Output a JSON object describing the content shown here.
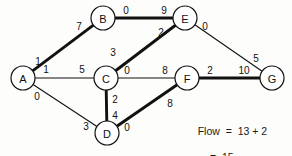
{
  "diagram": {
    "nodes": [
      {
        "id": "A",
        "label": "A",
        "cx": 23,
        "cy": 78,
        "r": 12
      },
      {
        "id": "B",
        "label": "B",
        "cx": 103,
        "cy": 18,
        "r": 12
      },
      {
        "id": "C",
        "label": "C",
        "cx": 106,
        "cy": 78,
        "r": 12
      },
      {
        "id": "D",
        "label": "D",
        "cx": 107,
        "cy": 133,
        "r": 12
      },
      {
        "id": "E",
        "label": "E",
        "cx": 185,
        "cy": 18,
        "r": 12
      },
      {
        "id": "F",
        "label": "F",
        "cx": 187,
        "cy": 78,
        "r": 12
      },
      {
        "id": "G",
        "label": "G",
        "cx": 272,
        "cy": 78,
        "r": 12
      }
    ],
    "edges": [
      {
        "from": "A",
        "to": "B",
        "bold": true,
        "tail_label": "1",
        "head_label": "7",
        "tail_lx": 38,
        "tail_ly": 61,
        "head_lx": 79,
        "head_ly": 26
      },
      {
        "from": "A",
        "to": "C",
        "bold": false,
        "tail_label": "1",
        "head_label": "5",
        "tail_lx": 46,
        "tail_ly": 69,
        "head_lx": 82,
        "head_ly": 69
      },
      {
        "from": "A",
        "to": "D",
        "bold": false,
        "tail_label": "0",
        "head_label": "3",
        "tail_lx": 37,
        "tail_ly": 96,
        "head_lx": 86,
        "head_ly": 126
      },
      {
        "from": "B",
        "to": "E",
        "bold": true,
        "tail_label": "0",
        "head_label": "9",
        "tail_lx": 126,
        "tail_ly": 10,
        "head_lx": 164,
        "head_ly": 10
      },
      {
        "from": "C",
        "to": "E",
        "bold": true,
        "tail_label": "3",
        "head_label": "2",
        "tail_lx": 113,
        "tail_ly": 52,
        "head_lx": 161,
        "head_ly": 32
      },
      {
        "from": "C",
        "to": "F",
        "bold": false,
        "tail_label": "0",
        "head_label": "8",
        "tail_lx": 127,
        "tail_ly": 70,
        "head_lx": 165,
        "head_ly": 70
      },
      {
        "from": "C",
        "to": "D",
        "bold": true,
        "tail_label": "2",
        "head_label": "4",
        "tail_lx": 115,
        "tail_ly": 99,
        "head_lx": 115,
        "head_ly": 115
      },
      {
        "from": "D",
        "to": "F",
        "bold": true,
        "tail_label": "0",
        "head_label": "8",
        "tail_lx": 127,
        "tail_ly": 127,
        "head_lx": 170,
        "head_ly": 103
      },
      {
        "from": "E",
        "to": "G",
        "bold": false,
        "tail_label": "0",
        "head_label": "5",
        "tail_lx": 205,
        "tail_ly": 26,
        "head_lx": 256,
        "head_ly": 58
      },
      {
        "from": "F",
        "to": "G",
        "bold": true,
        "tail_label": "2",
        "head_label": "10",
        "tail_lx": 210,
        "tail_ly": 70,
        "head_lx": 244,
        "head_ly": 70
      }
    ],
    "annotation": {
      "line1": "Flow  =  13 + 2",
      "line2": "=  15"
    },
    "colors": {
      "stroke": "#111111",
      "node_fill": "#ffffff",
      "background": "#fdfdfb",
      "text": "#1a1a1a"
    }
  }
}
